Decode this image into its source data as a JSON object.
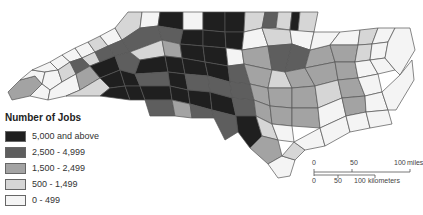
{
  "legend": {
    "title": "Number of Jobs",
    "items": [
      {
        "label": "5,000 and above",
        "color": "#1f1f1f"
      },
      {
        "label": "2,500 - 4,999",
        "color": "#5e5e5e"
      },
      {
        "label": "1,500 - 2,499",
        "color": "#a3a3a3"
      },
      {
        "label": "500 - 1,499",
        "color": "#d6d6d6"
      },
      {
        "label": "0 - 499",
        "color": "#f4f4f4"
      }
    ]
  },
  "scale_bar": {
    "miles": {
      "ticks": [
        "0",
        "50",
        "100"
      ],
      "unit": "miles"
    },
    "kilometers": {
      "ticks": [
        "0",
        "50",
        "100"
      ],
      "unit": "kilometers"
    }
  }
}
